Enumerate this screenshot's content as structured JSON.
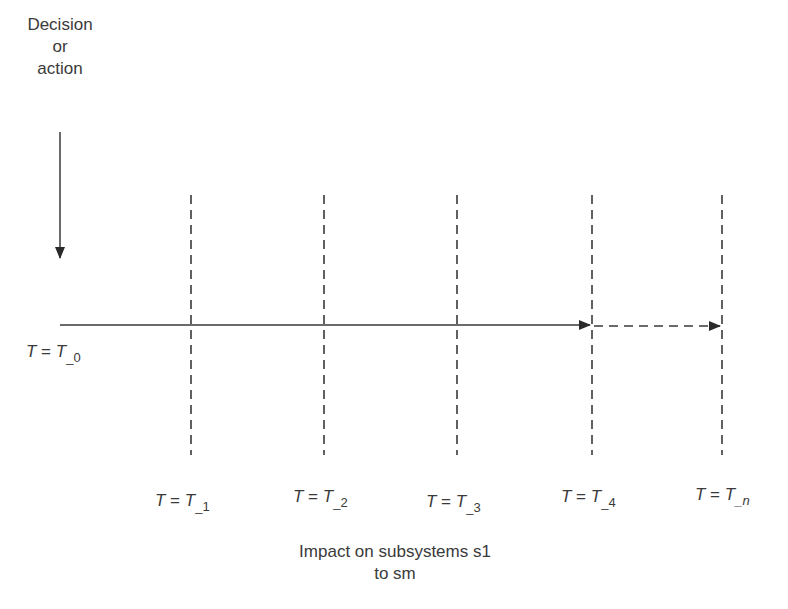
{
  "decision_label": {
    "line1": "Decision",
    "line2": "or",
    "line3": "action"
  },
  "time_labels": [
    {
      "lhs": "T",
      "eq": " = ",
      "rhs": "T",
      "sub": "_0"
    },
    {
      "lhs": "T",
      "eq": " = ",
      "rhs": "T",
      "sub": "_1"
    },
    {
      "lhs": "T",
      "eq": " = ",
      "rhs": "T",
      "sub": "_2"
    },
    {
      "lhs": "T",
      "eq": " = ",
      "rhs": "T",
      "sub": "_3"
    },
    {
      "lhs": "T",
      "eq": " = ",
      "rhs": "T",
      "sub": "_4"
    },
    {
      "lhs": "T",
      "eq": " = ",
      "rhs": "T",
      "sub": "_n"
    }
  ],
  "impact_label": {
    "line1": "Impact on subsystems s1",
    "line2": "to sm"
  },
  "colors": {
    "stroke": "#3a3a3a",
    "background": "#ffffff"
  }
}
